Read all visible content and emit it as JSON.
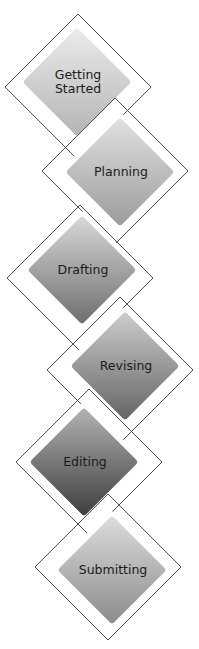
{
  "diagram": {
    "type": "process-staircase-diamonds",
    "steps": [
      {
        "label_lines": [
          "Getting",
          "Started"
        ],
        "fill_cx": 77,
        "fill_cy": 82,
        "outline_cx": 78,
        "outline_cy": 87,
        "gradient": [
          "#ececec",
          "#b4b4b4"
        ]
      },
      {
        "label_lines": [
          "Planning"
        ],
        "fill_cx": 120,
        "fill_cy": 172,
        "outline_cx": 115,
        "outline_cy": 171,
        "gradient": [
          "#e2e2e2",
          "#9a9a9a"
        ]
      },
      {
        "label_lines": [
          "Drafting"
        ],
        "fill_cx": 82,
        "fill_cy": 270,
        "outline_cx": 80,
        "outline_cy": 278,
        "gradient": [
          "#dadada",
          "#6c6c6c"
        ]
      },
      {
        "label_lines": [
          "Revising"
        ],
        "fill_cx": 125,
        "fill_cy": 366,
        "outline_cx": 120,
        "outline_cy": 370,
        "gradient": [
          "#cfcfcf",
          "#626262"
        ]
      },
      {
        "label_lines": [
          "Editing"
        ],
        "fill_cx": 84,
        "fill_cy": 462,
        "outline_cx": 89,
        "outline_cy": 462,
        "gradient": [
          "#b4b4b4",
          "#3c3c3c"
        ]
      },
      {
        "label_lines": [
          "Submitting"
        ],
        "fill_cx": 112,
        "fill_cy": 570,
        "outline_cx": 108,
        "outline_cy": 567,
        "gradient": [
          "#dedede",
          "#8a8a8a"
        ]
      }
    ],
    "fill_half_diagonal": 58,
    "outline_half_diagonal": 73,
    "outline_color": "#3a3a3a",
    "text_color": "#1a1a1a"
  }
}
